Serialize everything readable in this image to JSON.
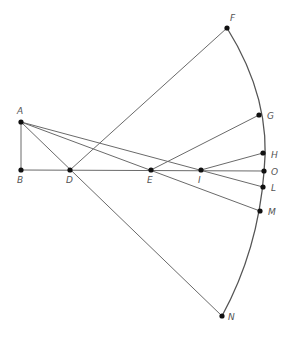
{
  "diagram": {
    "type": "geometric-construction",
    "colors": {
      "line": "#6a6a6a",
      "point": "#111111",
      "label": "#555555",
      "background": "#ffffff"
    },
    "points": {
      "A": {
        "label": "A",
        "x": 21,
        "y": 122
      },
      "B": {
        "label": "B",
        "x": 21,
        "y": 170
      },
      "D": {
        "label": "D",
        "x": 70,
        "y": 170
      },
      "E": {
        "label": "E",
        "x": 151,
        "y": 170
      },
      "I": {
        "label": "I",
        "x": 201,
        "y": 170
      },
      "O": {
        "label": "O",
        "x": 264,
        "y": 171
      },
      "F": {
        "label": "F",
        "x": 227,
        "y": 28
      },
      "G": {
        "label": "G",
        "x": 259,
        "y": 115
      },
      "H": {
        "label": "H",
        "x": 263,
        "y": 153
      },
      "L": {
        "label": "L",
        "x": 263,
        "y": 187
      },
      "M": {
        "label": "M",
        "x": 260,
        "y": 211
      },
      "N": {
        "label": "N",
        "x": 222,
        "y": 316
      }
    },
    "segments": [
      [
        "A",
        "B"
      ],
      [
        "B",
        "O"
      ],
      [
        "A",
        "N"
      ],
      [
        "D",
        "F"
      ],
      [
        "A",
        "L"
      ],
      [
        "A",
        "M"
      ],
      [
        "E",
        "G"
      ],
      [
        "I",
        "H"
      ]
    ],
    "arc": {
      "from": "F",
      "to": "N",
      "through": [
        "G",
        "H",
        "O",
        "L",
        "M"
      ]
    }
  }
}
